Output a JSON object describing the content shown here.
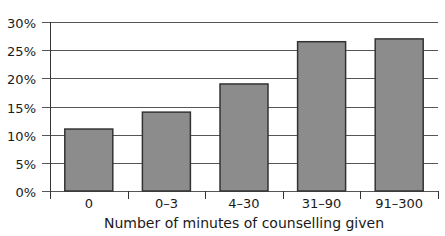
{
  "chart_data": {
    "type": "bar",
    "title": "",
    "xlabel": "Number of minutes of counselling given",
    "ylabel": "",
    "categories": [
      "0",
      "0–3",
      "4–30",
      "31–90",
      "91–300"
    ],
    "values": [
      11,
      14,
      19,
      26.5,
      27
    ],
    "value_format": "percent",
    "ylim": [
      0,
      30
    ],
    "yticks": [
      0,
      5,
      10,
      15,
      20,
      25,
      30
    ],
    "ytick_labels": [
      "0%",
      "5%",
      "10%",
      "15%",
      "20%",
      "25%",
      "30%"
    ],
    "grid": true,
    "legend": null,
    "colors": {
      "bar_fill": "#8c8c8c",
      "bar_stroke": "#333333",
      "grid": "#555555",
      "axis": "#333333"
    }
  }
}
